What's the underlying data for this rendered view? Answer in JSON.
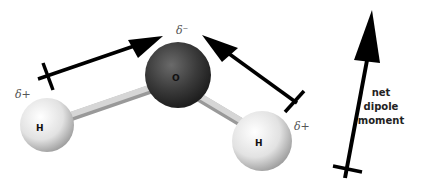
{
  "diagram": {
    "atoms": {
      "oxygen": {
        "label": "O",
        "charge": "δ⁻",
        "color": "#3a3a3a"
      },
      "hydrogen_left": {
        "label": "H",
        "charge": "δ+",
        "color": "#e8e8e8"
      },
      "hydrogen_right": {
        "label": "H",
        "charge": "δ+",
        "color": "#e8e8e8"
      }
    },
    "bond_dipoles": [
      {
        "name": "left-bond-dipole",
        "from": "H (left)",
        "to": "O"
      },
      {
        "name": "right-bond-dipole",
        "from": "H (right)",
        "to": "O"
      }
    ],
    "net_dipole": {
      "label_line1": "net",
      "label_line2": "dipole",
      "label_line3": "moment"
    },
    "colors": {
      "arrow": "#000000",
      "bond": "#b8b8b8"
    }
  }
}
